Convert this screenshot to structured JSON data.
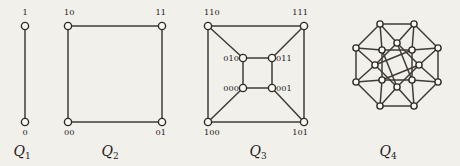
{
  "figure": {
    "background_color": "#f2f0ea",
    "edge_color": "#403c38",
    "node_fill": "#faf8f3",
    "node_stroke": "#2e2b28",
    "panels": [
      {
        "id": "q1",
        "caption_base": "Q",
        "caption_sub": "1",
        "caption_x": 22,
        "caption_y": 156,
        "vertex_labels": [
          {
            "text": "1",
            "x": 25,
            "y": 15,
            "anchor": "middle"
          },
          {
            "text": "0",
            "x": 25,
            "y": 135,
            "anchor": "middle"
          }
        ],
        "nodes": [
          {
            "name": "1",
            "x": 25,
            "y": 26
          },
          {
            "name": "0",
            "x": 25,
            "y": 122
          }
        ],
        "edges": [
          [
            0,
            1
          ]
        ]
      },
      {
        "id": "q2",
        "caption_base": "Q",
        "caption_sub": "2",
        "caption_x": 110,
        "caption_y": 156,
        "vertex_labels": [
          {
            "text": "10",
            "x": 64,
            "y": 15,
            "anchor": "start"
          },
          {
            "text": "11",
            "x": 166,
            "y": 15,
            "anchor": "end"
          },
          {
            "text": "00",
            "x": 64,
            "y": 135,
            "anchor": "start"
          },
          {
            "text": "01",
            "x": 166,
            "y": 135,
            "anchor": "end"
          }
        ],
        "nodes": [
          {
            "name": "10",
            "x": 68,
            "y": 26
          },
          {
            "name": "11",
            "x": 162,
            "y": 26
          },
          {
            "name": "00",
            "x": 68,
            "y": 122
          },
          {
            "name": "01",
            "x": 162,
            "y": 122
          }
        ],
        "edges": [
          [
            0,
            1
          ],
          [
            0,
            2
          ],
          [
            1,
            3
          ],
          [
            2,
            3
          ]
        ]
      },
      {
        "id": "q3",
        "caption_base": "Q",
        "caption_sub": "3",
        "caption_x": 258,
        "caption_y": 156,
        "vertex_labels": [
          {
            "text": "110",
            "x": 204,
            "y": 15,
            "anchor": "start"
          },
          {
            "text": "111",
            "x": 308,
            "y": 15,
            "anchor": "end"
          },
          {
            "text": "100",
            "x": 204,
            "y": 135,
            "anchor": "start"
          },
          {
            "text": "101",
            "x": 308,
            "y": 135,
            "anchor": "end"
          },
          {
            "text": "010",
            "x": 239,
            "y": 61,
            "anchor": "end"
          },
          {
            "text": "011",
            "x": 276,
            "y": 61,
            "anchor": "start"
          },
          {
            "text": "000",
            "x": 239,
            "y": 91,
            "anchor": "end"
          },
          {
            "text": "001",
            "x": 276,
            "y": 91,
            "anchor": "start"
          }
        ],
        "nodes": [
          {
            "name": "110",
            "x": 208,
            "y": 26
          },
          {
            "name": "111",
            "x": 304,
            "y": 26
          },
          {
            "name": "100",
            "x": 208,
            "y": 122
          },
          {
            "name": "101",
            "x": 304,
            "y": 122
          },
          {
            "name": "010",
            "x": 243,
            "y": 58
          },
          {
            "name": "011",
            "x": 272,
            "y": 58
          },
          {
            "name": "000",
            "x": 243,
            "y": 88
          },
          {
            "name": "001",
            "x": 272,
            "y": 88
          }
        ],
        "edges": [
          [
            0,
            1
          ],
          [
            0,
            2
          ],
          [
            1,
            3
          ],
          [
            2,
            3
          ],
          [
            4,
            5
          ],
          [
            4,
            6
          ],
          [
            5,
            7
          ],
          [
            6,
            7
          ],
          [
            0,
            4
          ],
          [
            1,
            5
          ],
          [
            2,
            6
          ],
          [
            3,
            7
          ]
        ]
      },
      {
        "id": "q4",
        "caption_base": "Q",
        "caption_sub": "4",
        "caption_x": 388,
        "caption_y": 156,
        "vertex_labels": [],
        "nodes": [
          {
            "name": "outer-n",
            "x": 380,
            "y": 24
          },
          {
            "name": "outer-ne",
            "x": 414,
            "y": 24
          },
          {
            "name": "outer-e-up",
            "x": 438,
            "y": 48
          },
          {
            "name": "outer-e-dn",
            "x": 438,
            "y": 82
          },
          {
            "name": "outer-se",
            "x": 414,
            "y": 106
          },
          {
            "name": "outer-s",
            "x": 380,
            "y": 106
          },
          {
            "name": "outer-w-dn",
            "x": 356,
            "y": 82
          },
          {
            "name": "outer-w-up",
            "x": 356,
            "y": 48
          },
          {
            "name": "mid-nw",
            "x": 382,
            "y": 50
          },
          {
            "name": "mid-ne",
            "x": 412,
            "y": 50
          },
          {
            "name": "mid-se",
            "x": 412,
            "y": 80
          },
          {
            "name": "mid-sw",
            "x": 382,
            "y": 80
          },
          {
            "name": "inner-n",
            "x": 397,
            "y": 43
          },
          {
            "name": "inner-e",
            "x": 419,
            "y": 65
          },
          {
            "name": "inner-s",
            "x": 397,
            "y": 87
          },
          {
            "name": "inner-w",
            "x": 375,
            "y": 65
          }
        ],
        "edges": [
          [
            0,
            1
          ],
          [
            1,
            2
          ],
          [
            2,
            3
          ],
          [
            3,
            4
          ],
          [
            4,
            5
          ],
          [
            5,
            6
          ],
          [
            6,
            7
          ],
          [
            7,
            0
          ],
          [
            8,
            9
          ],
          [
            9,
            10
          ],
          [
            10,
            11
          ],
          [
            11,
            8
          ],
          [
            12,
            13
          ],
          [
            13,
            14
          ],
          [
            14,
            15
          ],
          [
            15,
            12
          ],
          [
            0,
            8
          ],
          [
            0,
            12
          ],
          [
            1,
            9
          ],
          [
            1,
            12
          ],
          [
            2,
            9
          ],
          [
            2,
            13
          ],
          [
            3,
            10
          ],
          [
            3,
            13
          ],
          [
            4,
            10
          ],
          [
            4,
            14
          ],
          [
            5,
            11
          ],
          [
            5,
            14
          ],
          [
            6,
            11
          ],
          [
            6,
            15
          ],
          [
            7,
            8
          ],
          [
            7,
            15
          ],
          [
            8,
            14
          ],
          [
            9,
            15
          ],
          [
            10,
            12
          ],
          [
            11,
            13
          ]
        ]
      }
    ]
  }
}
